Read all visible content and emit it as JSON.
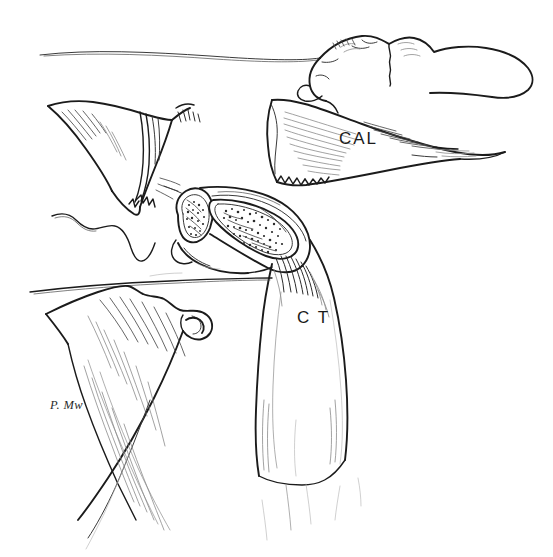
{
  "figure": {
    "kind": "anatomical-line-drawing",
    "background_color": "#ffffff",
    "ink_color": "#1b1b1b",
    "width": 553,
    "height": 557
  },
  "labels": [
    {
      "id": "cal",
      "text": "CAL",
      "x": 339,
      "y": 130,
      "refers_to": "coracoacromial-ligament-band"
    },
    {
      "id": "ct",
      "text": "C T",
      "x": 297,
      "y": 309,
      "refers_to": "conjoint-tendon-band"
    }
  ],
  "signature": {
    "text": "P. Mw",
    "x": 50,
    "y": 398
  },
  "structures": [
    {
      "id": "superior-contour",
      "name": "superior skin/bone contour line",
      "region": "top"
    },
    {
      "id": "acromion-process",
      "name": "acromion process",
      "region": "top-right"
    },
    {
      "id": "cal-band",
      "name": "coracoacromial ligament band",
      "region": "right"
    },
    {
      "id": "coracoid-fan",
      "name": "coracoid / scapular fan-shaped bone",
      "region": "upper-left"
    },
    {
      "id": "cut-tendon-crosssection",
      "name": "cut tendon cross-section with stippled fibres",
      "region": "center"
    },
    {
      "id": "ct-band",
      "name": "conjoint tendon descending band",
      "region": "center-lower"
    },
    {
      "id": "humeral-head",
      "name": "humeral head / tuberosity",
      "region": "lower-left"
    },
    {
      "id": "muscle-striations",
      "name": "muscle fibre striations",
      "region": "lower-left"
    }
  ]
}
